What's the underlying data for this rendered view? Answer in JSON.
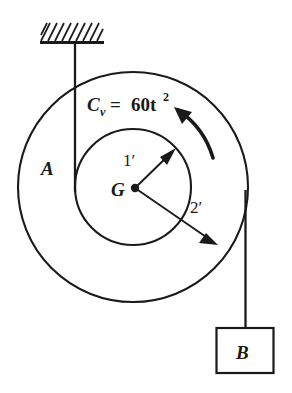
{
  "figure": {
    "background_color": "#ffffff",
    "ink_color": "#1a1a1a"
  },
  "support": {
    "name": "fixed-ceiling-support",
    "hatching": "diagonal-hatch"
  },
  "pulley": {
    "label_outer": "A",
    "center_label": "G",
    "outer_radius_label": "2′",
    "inner_radius_label": "1′",
    "outer_radius_value": 2,
    "inner_radius_value": 1,
    "radius_units": "ft"
  },
  "couple": {
    "symbol": "C",
    "subscript": "v",
    "equals": "=",
    "magnitude": "60t",
    "exponent": "2",
    "full_text": "C_v = 60t^2",
    "direction": "counterclockwise"
  },
  "block": {
    "label": "B"
  },
  "cords": {
    "left_cord_name": "cord-to-ceiling",
    "right_cord_name": "cord-to-block"
  }
}
